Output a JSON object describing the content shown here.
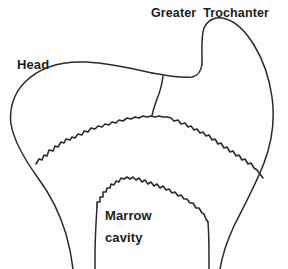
{
  "figure": {
    "background_color": "#fdfdfd",
    "line_color": "#2a2a28",
    "text_color": "#1d1d1b"
  },
  "labels": {
    "greater_trochanter": "Greater  Trochanter",
    "head": "Head",
    "marrow_cavity_line1": "Marrow",
    "marrow_cavity_line2": "cavity"
  },
  "structures": [
    {
      "name": "femoral-head",
      "label": "Head"
    },
    {
      "name": "greater-trochanter",
      "label": "Greater  Trochanter"
    },
    {
      "name": "marrow-cavity",
      "label": "Marrow cavity"
    },
    {
      "name": "trabecular-bone-boundary",
      "label": ""
    },
    {
      "name": "femoral-shaft-cortex",
      "label": ""
    }
  ]
}
